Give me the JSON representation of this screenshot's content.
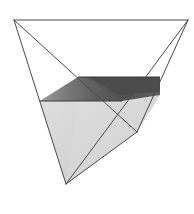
{
  "figure": {
    "title": "Tetrahedron with horizontal liquid cross-section",
    "type": "geometric-illustration",
    "canvas": {
      "width": 194,
      "height": 214,
      "background": "#ffffff"
    },
    "colors": {
      "edge_stroke": "#4a4a4a",
      "body_fill": "#d9d9d9",
      "liquid_top_dark": "#4f4f4f",
      "liquid_top_mid": "#6e6e6e",
      "liquid_top_light": "#a8a8a8",
      "liquid_face_light": "#f2f2f2",
      "liquid_face_mid": "#bdbdbd",
      "highlight": "#ffffff"
    },
    "vertices": [
      {
        "name": "top-left",
        "x": 14,
        "y": 20
      },
      {
        "name": "top-right",
        "x": 188,
        "y": 20
      },
      {
        "name": "right",
        "x": 137,
        "y": 132
      },
      {
        "name": "bottom",
        "x": 66,
        "y": 184
      }
    ],
    "liquid_plane": {
      "label": "liquid level",
      "front_y": 101,
      "back_y": 77,
      "front_left_x": 40,
      "front_right_x": 122,
      "back_left_x": 78,
      "back_right_x": 160
    },
    "edges": [
      {
        "name": "top-edge",
        "from": "top-left",
        "to": "top-right",
        "style": "solid"
      },
      {
        "name": "left-edge",
        "from": "top-left",
        "to": "bottom",
        "style": "solid"
      },
      {
        "name": "left-back-edge",
        "from": "top-left",
        "to": "right",
        "style": "solid"
      },
      {
        "name": "right-edge",
        "from": "top-right",
        "to": "right",
        "style": "solid"
      },
      {
        "name": "right-front-edge",
        "from": "top-right",
        "to": "bottom",
        "style": "solid"
      },
      {
        "name": "bottom-edge",
        "from": "right",
        "to": "bottom",
        "style": "solid"
      }
    ],
    "stroke_width": 1
  }
}
